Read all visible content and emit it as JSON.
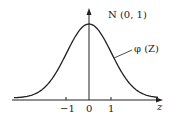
{
  "chart_data": {
    "type": "line",
    "title": "N (0, 1)",
    "series": [
      {
        "name": "φ (Z)",
        "function": "standard normal density"
      }
    ],
    "xlabel": "z",
    "ylabel": "",
    "x_ticks": [
      "−1",
      "0",
      "1"
    ],
    "x": [
      -3,
      -2.5,
      -2,
      -1.5,
      -1,
      -0.5,
      0,
      0.5,
      1,
      1.5,
      2,
      2.5,
      3
    ],
    "values": [
      0.004,
      0.018,
      0.054,
      0.13,
      0.242,
      0.352,
      0.399,
      0.352,
      0.242,
      0.13,
      0.054,
      0.018,
      0.004
    ],
    "annotations": [
      "N (0, 1)",
      "φ (Z)"
    ],
    "grid": false,
    "legend": "none"
  },
  "labels": {
    "dist": "N (0, 1)",
    "curve": "φ (Z)",
    "xaxis": "z",
    "tick_neg1": "−1",
    "tick_0": "0",
    "tick_1": "1"
  },
  "colors": {
    "line": "#222222",
    "background": "#ffffff"
  }
}
